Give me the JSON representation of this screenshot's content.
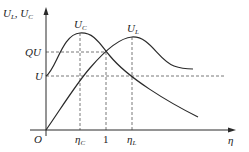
{
  "diagram": {
    "y_axis_label": "U_L, U_C",
    "x_axis_label": "η",
    "origin_label": "O",
    "y_ticks": [
      {
        "label": "QU",
        "level": "QU"
      },
      {
        "label": "U",
        "level": "U"
      }
    ],
    "x_ticks": [
      {
        "label": "η_C",
        "main": "η",
        "sub": "C"
      },
      {
        "label": "1",
        "main": "1",
        "sub": ""
      },
      {
        "label": "η_L",
        "main": "η",
        "sub": "L"
      }
    ],
    "curves": [
      {
        "name": "U_C",
        "main": "U",
        "sub": "C",
        "peak_at": "η_C",
        "peak_value": "above QU"
      },
      {
        "name": "U_L",
        "main": "U",
        "sub": "L",
        "peak_at": "η_L",
        "peak_value": "above QU"
      }
    ],
    "intersection": {
      "x": "1",
      "y": "QU"
    },
    "colors": {
      "line": "#2a2a2a",
      "dash": "#555555",
      "background": "#ffffff"
    }
  },
  "labels": {
    "y_axis_main1": "U",
    "y_axis_sub1": "L",
    "y_axis_sep": ", ",
    "y_axis_main2": "U",
    "y_axis_sub2": "C",
    "qu": "QU",
    "u": "U",
    "origin": "O",
    "eta": "η",
    "etaC_main": "η",
    "etaC_sub": "C",
    "one": "1",
    "etaL_main": "η",
    "etaL_sub": "L",
    "uc_main": "U",
    "uc_sub": "C",
    "ul_main": "U",
    "ul_sub": "L"
  }
}
